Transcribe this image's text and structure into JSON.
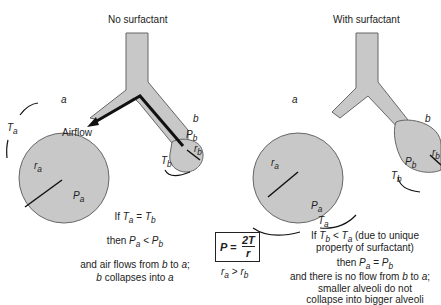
{
  "left_panel": {
    "title": "No surfactant",
    "label_a": "a",
    "label_b": "b",
    "airflow": "Airflow",
    "Ta": "T",
    "Ta_sub": "a",
    "Tb": "T",
    "Tb_sub": "b",
    "ra": "r",
    "ra_sub": "a",
    "rb": "r",
    "rb_sub": "b",
    "Pa": "P",
    "Pa_sub": "a",
    "Pb": "P",
    "Pb_sub": "b",
    "line1": "If T_a = T_b",
    "line2": "then P_a < P_b",
    "line3": "and air flows from b to a;",
    "line4": "b collapses into a"
  },
  "center": {
    "formula": "P = 2T / r",
    "formula_lhs": "P =",
    "formula_num": "2T",
    "formula_den": "r",
    "relation": "r_a > r_b"
  },
  "right_panel": {
    "title": "With surfactant",
    "label_a": "a",
    "label_b": "b",
    "line1": "If T_b < T_a (due to unique",
    "line1b": "property of surfactant)",
    "line2": "then P_a = P_b",
    "line3": "and there is no flow from b to a;",
    "line4": "smaller alveoli do not",
    "line5": "collapse into bigger alveoli"
  },
  "colors": {
    "alveolus_fill": "#c8c8c8",
    "outline": "#555555",
    "arrow": "#111111"
  }
}
